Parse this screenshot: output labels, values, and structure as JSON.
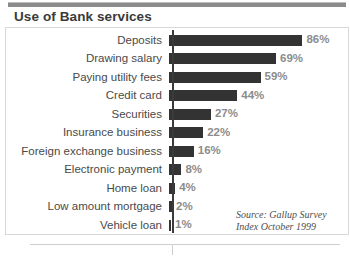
{
  "chart_title": "Use of Bank services",
  "source_note": {
    "line1": "Source: Gallup Survey",
    "line2": "Index October 1999"
  },
  "colors": {
    "bar": "#333333",
    "value_label": "#8c8c8c",
    "category_label": "#4a4a4a",
    "title": "#3a3a3a",
    "axis": "#3b3b3b",
    "frame": "#d8d8d8",
    "top_rule": "#8b8b8b"
  },
  "chart_data": {
    "type": "bar",
    "orientation": "horizontal",
    "title": "Use of Bank services",
    "xlabel": "",
    "ylabel": "",
    "xlim": [
      0,
      100
    ],
    "grid": false,
    "legend": false,
    "value_suffix": "%",
    "categories": [
      "Deposits",
      "Drawing salary",
      "Paying utility fees",
      "Credit card",
      "Securities",
      "Insurance business",
      "Foreign exchange business",
      "Electronic payment",
      "Home loan",
      "Low amount mortgage",
      "Vehicle loan"
    ],
    "values": [
      86,
      69,
      59,
      44,
      27,
      22,
      16,
      8,
      4,
      2,
      1
    ],
    "value_labels": [
      "86%",
      "69%",
      "59%",
      "44%",
      "27%",
      "22%",
      "16%",
      "8%",
      "4%",
      "2%",
      "1%"
    ],
    "annotations": [
      "Source: Gallup Survey",
      "Index October 1999"
    ]
  }
}
